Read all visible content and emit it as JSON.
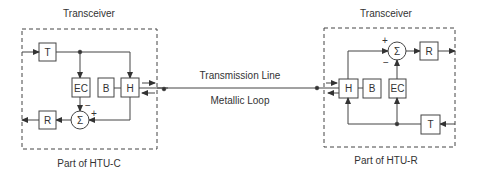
{
  "left": {
    "title": "Transceiver",
    "caption": "Part of HTU-C",
    "blocks": {
      "t": "T",
      "ec": "EC",
      "b": "B",
      "h": "H",
      "r": "R",
      "sum": "Σ"
    },
    "signs": {
      "minus": "−",
      "plus": "+"
    }
  },
  "right": {
    "title": "Transceiver",
    "caption": "Part of HTU-R",
    "blocks": {
      "t": "T",
      "ec": "EC",
      "b": "B",
      "h": "H",
      "r": "R",
      "sum": "Σ"
    },
    "signs": {
      "minus": "−",
      "plus": "+"
    }
  },
  "line": {
    "top_label": "Transmission Line",
    "bottom_label": "Metallic Loop"
  }
}
